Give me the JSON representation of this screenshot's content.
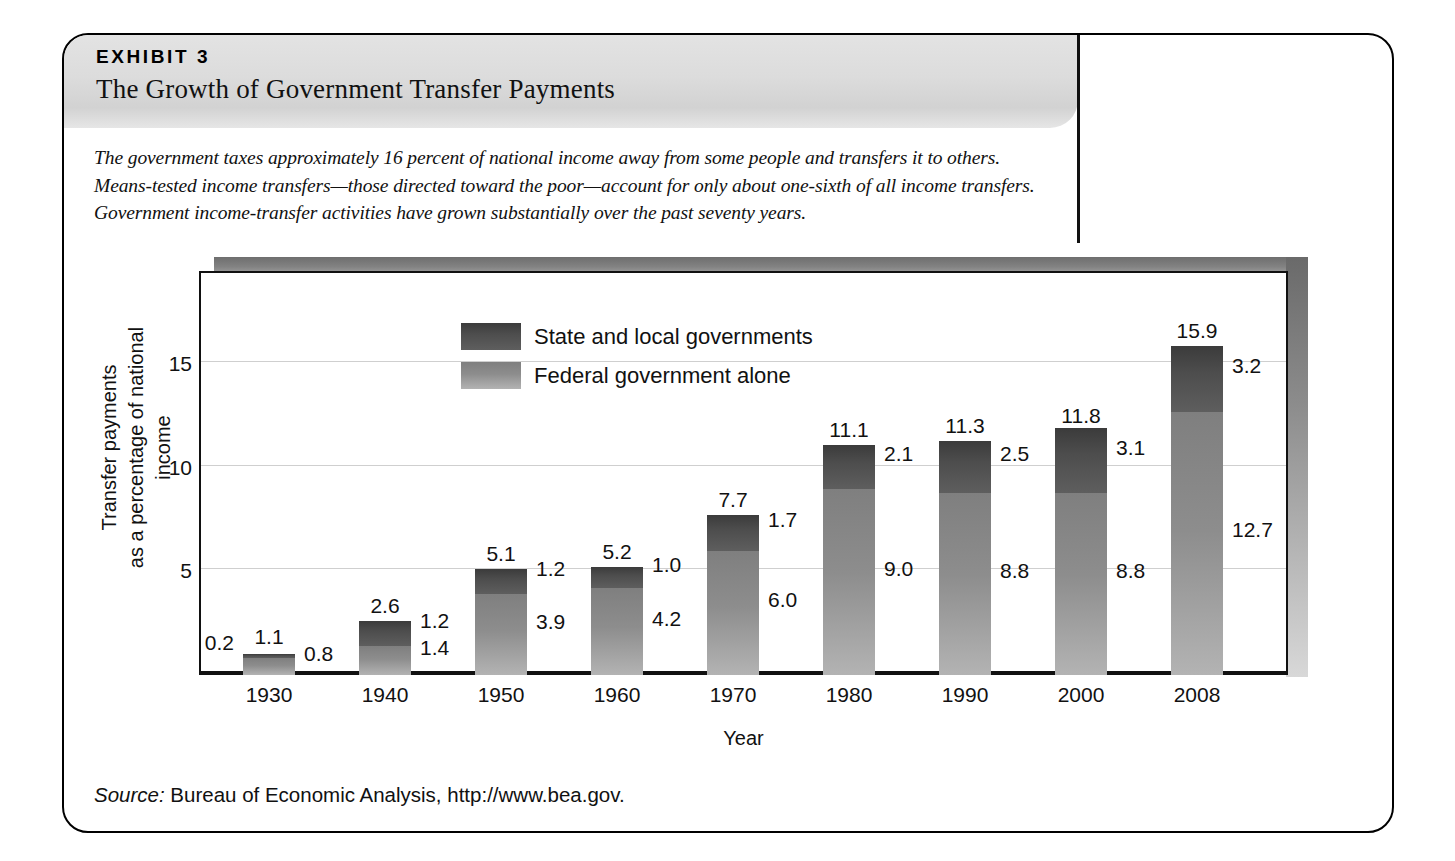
{
  "exhibit": {
    "kicker": "EXHIBIT 3",
    "title": "The Growth of Government Transfer Payments",
    "caption": "The government taxes approximately 16 percent of national income away from some people and transfers it to others. Means-tested income transfers—those directed toward the poor—account for only about one-sixth of all income transfers. Government income-transfer activities have grown substantially over the past seventy years.",
    "source_label": "Source:",
    "source_text": " Bureau of Economic Analysis, http://www.bea.gov."
  },
  "chart_data": {
    "type": "bar",
    "subtype": "stacked",
    "title": "The Growth of Government Transfer Payments",
    "xlabel": "Year",
    "ylabel": "Transfer payments as a percentage of national income",
    "ylabel_line1": "Transfer payments",
    "ylabel_line2": "as a percentage of national income",
    "categories": [
      "1930",
      "1940",
      "1950",
      "1960",
      "1970",
      "1980",
      "1990",
      "2000",
      "2008"
    ],
    "ylim": [
      0,
      19.5
    ],
    "yticks": [
      5,
      10,
      15
    ],
    "ytick_labels": [
      "5",
      "10",
      "15"
    ],
    "grid": true,
    "legend_position": "upper-left-inside",
    "series": [
      {
        "name": "Federal government alone",
        "color": "#8d8d8d",
        "values": [
          0.8,
          1.4,
          3.9,
          4.2,
          6.0,
          9.0,
          8.8,
          8.8,
          12.7
        ],
        "value_labels": [
          "0.8",
          "1.4",
          "3.9",
          "4.2",
          "6.0",
          "9.0",
          "8.8",
          "8.8",
          "12.7"
        ]
      },
      {
        "name": "State and local governments",
        "color": "#4d4d4d",
        "values": [
          0.2,
          1.2,
          1.2,
          1.0,
          1.7,
          2.1,
          2.5,
          3.1,
          3.2
        ],
        "value_labels": [
          "0.2",
          "1.2",
          "1.2",
          "1.0",
          "1.7",
          "2.1",
          "2.5",
          "3.1",
          "3.2"
        ]
      }
    ],
    "totals": [
      1.1,
      2.6,
      5.1,
      5.2,
      7.7,
      11.1,
      11.3,
      11.8,
      15.9
    ],
    "total_labels": [
      "1.1",
      "2.6",
      "5.1",
      "5.2",
      "7.7",
      "11.1",
      "11.3",
      "11.8",
      "15.9"
    ],
    "annotations": {
      "state_label_side": [
        "left",
        "right",
        "right",
        "right",
        "right",
        "right",
        "right",
        "right",
        "right"
      ]
    }
  }
}
